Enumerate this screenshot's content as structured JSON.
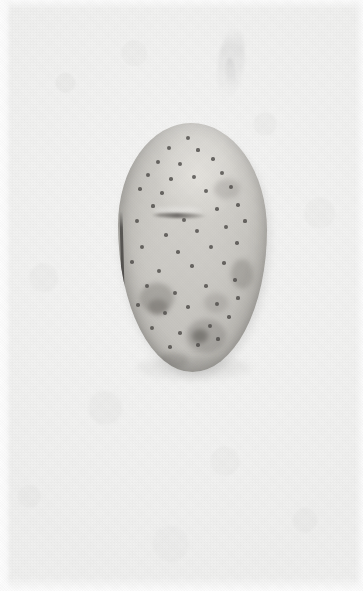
{
  "image": {
    "domain": "Natural-Image",
    "subject": "potato",
    "caption": "A single raw potato tuber photographed on a plain off-white background",
    "width_px": 363,
    "height_px": 591,
    "orientation": "portrait",
    "alt_text": "Close-up photograph of one oval russet-white potato centered on a pale background"
  },
  "background": {
    "name": "plain studio backdrop",
    "base_color": "#f3f3f2",
    "highlight_color": "#f6f6f5",
    "shadow_color": "#eeeeed",
    "texture": "fine paper grain with faint mottling",
    "margin_color": "#fdfdfd",
    "wisp_note": "faint pale smudge near upper right"
  },
  "subject": {
    "name": "potato",
    "shape": "vertical oval / ovoid",
    "skin_color": "#cac8c3",
    "highlight_color": "#e3e1dc",
    "shade_color": "#b0aea9",
    "edge_line_color": "#464442",
    "eye_color": "#4e4c49",
    "blemish_color": "#8a8783",
    "bounds": {
      "left": 120,
      "top": 125,
      "right": 267,
      "bottom": 372
    },
    "center": {
      "x": 193,
      "y": 248
    },
    "width_px": 147,
    "height_px": 247,
    "features": [
      "scattered dark eye spots across the skin",
      "horizontal healed crease near the upper-middle",
      "dark hard edge line along the left flank",
      "dark blemish cluster on the lower left",
      "sprouting eye with surrounding bruise at bottom center",
      "diamond-shaped scar near the right edge",
      "bright specular highlight on the upper-center dome"
    ]
  },
  "eyes": [
    {
      "x": 70,
      "y": 15,
      "r": 2.0
    },
    {
      "x": 51,
      "y": 25,
      "r": 2.2
    },
    {
      "x": 80,
      "y": 27,
      "r": 1.6
    },
    {
      "x": 40,
      "y": 39,
      "r": 2.3
    },
    {
      "x": 62,
      "y": 41,
      "r": 2.1
    },
    {
      "x": 95,
      "y": 36,
      "r": 1.7
    },
    {
      "x": 30,
      "y": 52,
      "r": 2.0
    },
    {
      "x": 53,
      "y": 56,
      "r": 1.8
    },
    {
      "x": 76,
      "y": 54,
      "r": 1.9
    },
    {
      "x": 104,
      "y": 50,
      "r": 2.1
    },
    {
      "x": 22,
      "y": 66,
      "r": 1.8
    },
    {
      "x": 44,
      "y": 70,
      "r": 1.7
    },
    {
      "x": 88,
      "y": 68,
      "r": 2.0
    },
    {
      "x": 113,
      "y": 64,
      "r": 1.9
    },
    {
      "x": 35,
      "y": 83,
      "r": 1.6
    },
    {
      "x": 66,
      "y": 97,
      "r": 2.4
    },
    {
      "x": 99,
      "y": 86,
      "r": 1.8
    },
    {
      "x": 120,
      "y": 82,
      "r": 1.7
    },
    {
      "x": 19,
      "y": 98,
      "r": 1.9
    },
    {
      "x": 48,
      "y": 112,
      "r": 1.8
    },
    {
      "x": 79,
      "y": 108,
      "r": 2.0
    },
    {
      "x": 108,
      "y": 104,
      "r": 1.9
    },
    {
      "x": 127,
      "y": 98,
      "r": 1.6
    },
    {
      "x": 24,
      "y": 124,
      "r": 2.0
    },
    {
      "x": 60,
      "y": 129,
      "r": 1.8
    },
    {
      "x": 93,
      "y": 124,
      "r": 1.9
    },
    {
      "x": 119,
      "y": 120,
      "r": 1.7
    },
    {
      "x": 14,
      "y": 139,
      "r": 1.8
    },
    {
      "x": 41,
      "y": 148,
      "r": 2.1
    },
    {
      "x": 74,
      "y": 143,
      "r": 1.7
    },
    {
      "x": 106,
      "y": 140,
      "r": 1.8
    },
    {
      "x": 29,
      "y": 163,
      "r": 2.2
    },
    {
      "x": 57,
      "y": 170,
      "r": 1.9
    },
    {
      "x": 88,
      "y": 163,
      "r": 1.8
    },
    {
      "x": 117,
      "y": 157,
      "r": 1.7
    },
    {
      "x": 20,
      "y": 182,
      "r": 1.8
    },
    {
      "x": 47,
      "y": 190,
      "r": 2.0
    },
    {
      "x": 70,
      "y": 184,
      "r": 1.7
    },
    {
      "x": 99,
      "y": 181,
      "r": 1.9
    },
    {
      "x": 120,
      "y": 175,
      "r": 1.6
    },
    {
      "x": 34,
      "y": 205,
      "r": 1.9
    },
    {
      "x": 62,
      "y": 210,
      "r": 1.8
    },
    {
      "x": 92,
      "y": 203,
      "r": 2.0
    },
    {
      "x": 111,
      "y": 194,
      "r": 1.7
    },
    {
      "x": 52,
      "y": 224,
      "r": 1.8
    },
    {
      "x": 80,
      "y": 222,
      "r": 1.7
    },
    {
      "x": 100,
      "y": 216,
      "r": 1.6
    }
  ],
  "patches": [
    {
      "x": 22,
      "y": 160,
      "w": 34,
      "h": 30,
      "color": "rgba(118,114,110,.40)"
    },
    {
      "x": 30,
      "y": 176,
      "w": 20,
      "h": 16,
      "color": "rgba(104,100,96,.46)"
    },
    {
      "x": 68,
      "y": 196,
      "w": 40,
      "h": 34,
      "color": "rgba(118,114,110,.34)"
    },
    {
      "x": 74,
      "y": 206,
      "w": 16,
      "h": 14,
      "color": "rgba(92,89,85,.58)"
    },
    {
      "x": 113,
      "y": 136,
      "w": 22,
      "h": 30,
      "color": "rgba(122,118,114,.38)"
    },
    {
      "x": 96,
      "y": 56,
      "w": 26,
      "h": 20,
      "color": "rgba(126,122,118,.28)"
    },
    {
      "x": 86,
      "y": 170,
      "w": 24,
      "h": 20,
      "color": "rgba(124,120,116,.26)"
    },
    {
      "x": 40,
      "y": 230,
      "w": 30,
      "h": 16,
      "color": "rgba(120,116,112,.30)"
    }
  ]
}
